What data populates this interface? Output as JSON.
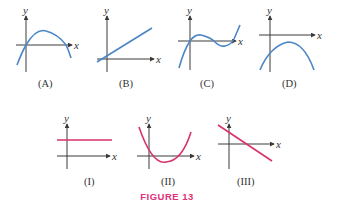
{
  "figure": {
    "caption": "FIGURE 13",
    "caption_color": "#e0307a",
    "top_row_color": "#4a86c5",
    "bottom_row_color": "#d8316b",
    "axis_labels": {
      "x": "x",
      "y": "y"
    },
    "panels": [
      {
        "id": "A",
        "label": "(A)",
        "shape": "downward parabola through origin, crosses x-axis twice"
      },
      {
        "id": "B",
        "label": "(B)",
        "shape": "increasing line with positive y-intercept"
      },
      {
        "id": "C",
        "label": "(C)",
        "shape": "cubic through origin with local max and min"
      },
      {
        "id": "D",
        "label": "(D)",
        "shape": "downward parabola entirely below x-axis"
      },
      {
        "id": "I",
        "label": "(I)",
        "shape": "horizontal line above x-axis"
      },
      {
        "id": "II",
        "label": "(II)",
        "shape": "upward parabola dipping below x-axis"
      },
      {
        "id": "III",
        "label": "(III)",
        "shape": "decreasing line with positive y-intercept"
      }
    ]
  }
}
